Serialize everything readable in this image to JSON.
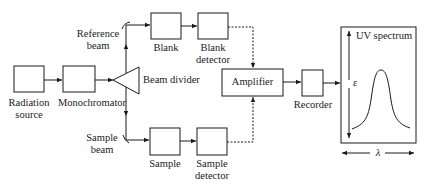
{
  "diagram": {
    "components": {
      "radiation_source": {
        "line1": "Radiation",
        "line2": "source"
      },
      "monochromator": {
        "label": "Monochromator"
      },
      "beam_divider": {
        "label": "Beam divider"
      },
      "reference_beam": {
        "line1": "Reference",
        "line2": "beam"
      },
      "sample_beam": {
        "line1": "Sample",
        "line2": "beam"
      },
      "blank": {
        "label": "Blank"
      },
      "blank_detector": {
        "line1": "Blank",
        "line2": "detector"
      },
      "sample": {
        "label": "Sample"
      },
      "sample_detector": {
        "line1": "Sample",
        "line2": "detector"
      },
      "amplifier": {
        "label": "Amplifier"
      },
      "recorder": {
        "label": "Recorder"
      },
      "spectrum": {
        "title": "UV spectrum",
        "y_axis": "ε",
        "x_axis": "λ"
      }
    },
    "colors": {
      "stroke": "#1a1a1a",
      "background": "#ffffff"
    }
  }
}
